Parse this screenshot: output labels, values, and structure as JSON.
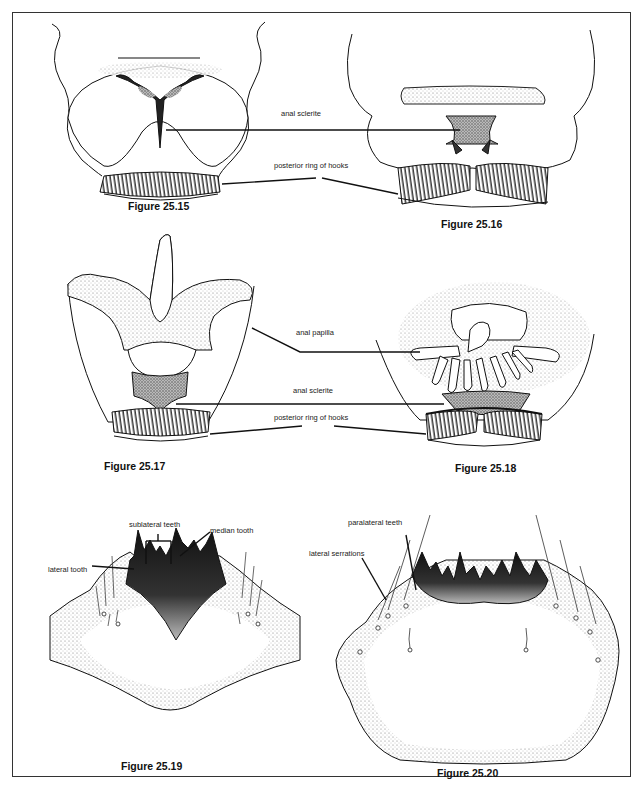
{
  "figures": {
    "f15": {
      "caption": "Figure 25.15"
    },
    "f16": {
      "caption": "Figure 25.16"
    },
    "f17": {
      "caption": "Figure 25.17"
    },
    "f18": {
      "caption": "Figure 25.18"
    },
    "f19": {
      "caption": "Figure 25.19"
    },
    "f20": {
      "caption": "Figure 25.20"
    }
  },
  "labels": {
    "row1": {
      "anal_sclerite": "anal sclerite",
      "posterior_ring": "posterior ring of hooks"
    },
    "row2": {
      "anal_papilla": "anal papilla",
      "anal_sclerite": "anal sclerite",
      "posterior_ring": "posterior ring of hooks"
    },
    "row3_left": {
      "sublateral_teeth": "sublateral teeth",
      "median_tooth": "median tooth",
      "lateral_tooth": "lateral tooth"
    },
    "row3_right": {
      "paralateral_teeth": "paralateral teeth",
      "lateral_serrations": "lateral serrations"
    }
  },
  "colors": {
    "ink": "#111111",
    "stipple": "#9a9a9a",
    "border": "#333333",
    "background": "#ffffff"
  }
}
